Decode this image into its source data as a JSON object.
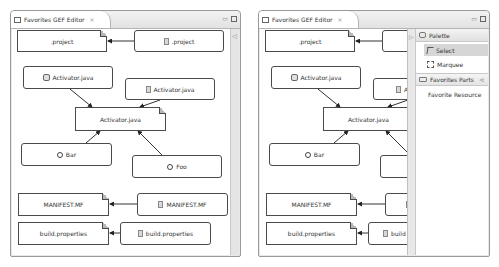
{
  "editors": [
    {
      "id": "left",
      "tab": {
        "title": "Favorites GEF Editor",
        "close_icon": "×"
      },
      "window_controls": {
        "minimize": "▭",
        "maximize": "□"
      },
      "scrollbar_arrow": "◁",
      "nodes": [
        {
          "id": "n1",
          "label": ".project",
          "style": "folded",
          "icon": null
        },
        {
          "id": "n2",
          "label": ".project",
          "style": "rounded",
          "icon": "file-icon"
        },
        {
          "id": "n3",
          "label": "Activator.java",
          "style": "rounded",
          "icon": "java-project-icon"
        },
        {
          "id": "n4",
          "label": "Activator.java",
          "style": "rounded",
          "icon": "file-icon"
        },
        {
          "id": "n5",
          "label": "Activator.java",
          "style": "folded",
          "icon": null
        },
        {
          "id": "n6",
          "label": "Bar",
          "style": "rounded",
          "icon": "class-icon"
        },
        {
          "id": "n7",
          "label": "Foo",
          "style": "rounded",
          "icon": "class-icon"
        },
        {
          "id": "n8",
          "label": "MANIFEST.MF",
          "style": "folded",
          "icon": null
        },
        {
          "id": "n9",
          "label": "MANIFEST.MF",
          "style": "rounded",
          "icon": "file-icon"
        },
        {
          "id": "n10",
          "label": "build.properties",
          "style": "folded",
          "icon": null
        },
        {
          "id": "n11",
          "label": "build.properties",
          "style": "rounded",
          "icon": "file-icon"
        }
      ]
    },
    {
      "id": "right",
      "tab": {
        "title": "Favorites GEF Editor",
        "close_icon": "×"
      },
      "window_controls": {
        "minimize": "▭",
        "maximize": "□"
      },
      "nodes": [
        {
          "id": "r1",
          "label": ".project",
          "style": "folded",
          "icon": null
        },
        {
          "id": "r2",
          "label": "",
          "style": "rounded",
          "icon": null
        },
        {
          "id": "r3",
          "label": "Activator.java",
          "style": "rounded",
          "icon": "java-project-icon"
        },
        {
          "id": "r4",
          "label": "Ac",
          "style": "rounded",
          "icon": "file-icon"
        },
        {
          "id": "r5",
          "label": "Activator.java",
          "style": "folded",
          "icon": null
        },
        {
          "id": "r6",
          "label": "Bar",
          "style": "rounded",
          "icon": "class-icon"
        },
        {
          "id": "r7",
          "label": "",
          "style": "rounded",
          "icon": null
        },
        {
          "id": "r8",
          "label": "MANIFEST.MF",
          "style": "folded",
          "icon": null
        },
        {
          "id": "r9",
          "label": "",
          "style": "rounded",
          "icon": "file-icon"
        },
        {
          "id": "r10",
          "label": "build.properties",
          "style": "folded",
          "icon": null
        },
        {
          "id": "r11",
          "label": "build",
          "style": "rounded",
          "icon": "file-icon"
        }
      ],
      "palette": {
        "collapse_arrow": "▷",
        "header": "Palette",
        "tools": [
          {
            "label": "Select",
            "icon": "arrow-icon",
            "selected": true
          },
          {
            "label": "Marquee",
            "icon": "marquee-icon",
            "selected": false
          }
        ],
        "drawer": {
          "label": "Favorites Parts",
          "pin_icon": "⊲",
          "entries": [
            {
              "label": "Favorite Resource"
            }
          ]
        }
      }
    }
  ],
  "colors": {
    "node_border": "#4a4a4a",
    "frame_border": "#9a9a9a",
    "selected_tool_bg": "#d6d6d6"
  }
}
